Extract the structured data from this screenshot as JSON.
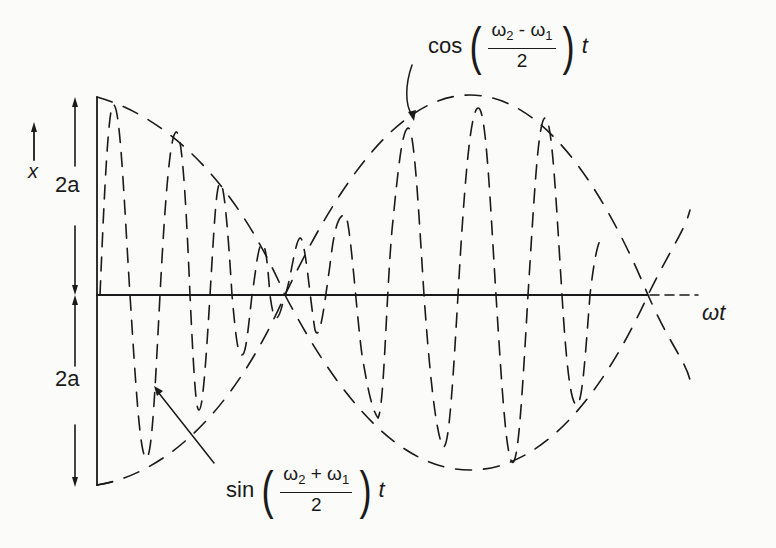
{
  "diagram": {
    "type": "beat-waveform",
    "axes": {
      "vertical_label": "x",
      "horizontal_label": "ωt",
      "upper_amplitude_label": "2a",
      "lower_amplitude_label": "2a"
    },
    "annotations": {
      "envelope": {
        "fn": "cos",
        "num_left": "ω",
        "num_left_sub": "2",
        "num_op": " - ",
        "num_right": "ω",
        "num_right_sub": "1",
        "den": "2",
        "var": "t"
      },
      "carrier": {
        "fn": "sin",
        "num_left": "ω",
        "num_left_sub": "2",
        "num_op": " + ",
        "num_right": "ω",
        "num_right_sub": "1",
        "den": "2",
        "var": "t"
      }
    },
    "colors": {
      "ink": "#1a1a1a",
      "paper": "#fbfbf9"
    }
  }
}
